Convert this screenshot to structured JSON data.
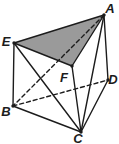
{
  "figure": {
    "type": "triangular-prism",
    "canvas": {
      "width": 119,
      "height": 144,
      "background": "#ffffff"
    },
    "style": {
      "stroke_color": "#1c1c1c",
      "shade_color": "#9a9a9a",
      "stroke_width": 1.4,
      "dash_pattern": "4 3",
      "dot_radius": 1.7,
      "label_font_size": 13
    },
    "vertices": [
      {
        "id": "A",
        "label": "A",
        "x": 104,
        "y": 15,
        "lx": 110,
        "ly": 13
      },
      {
        "id": "B",
        "label": "B",
        "x": 13,
        "y": 106,
        "lx": 6,
        "ly": 116
      },
      {
        "id": "C",
        "label": "C",
        "x": 81,
        "y": 132,
        "lx": 78,
        "ly": 143
      },
      {
        "id": "D",
        "label": "D",
        "x": 108,
        "y": 80,
        "lx": 113,
        "ly": 84
      },
      {
        "id": "E",
        "label": "E",
        "x": 14,
        "y": 43,
        "lx": 6,
        "ly": 46
      },
      {
        "id": "F",
        "label": "F",
        "x": 72,
        "y": 66,
        "lx": 64,
        "ly": 82
      }
    ],
    "shaded_face": [
      "E",
      "A",
      "F"
    ],
    "edges": [
      {
        "from": "E",
        "to": "A",
        "style": "solid"
      },
      {
        "from": "A",
        "to": "F",
        "style": "solid"
      },
      {
        "from": "F",
        "to": "E",
        "style": "solid"
      },
      {
        "from": "E",
        "to": "B",
        "style": "solid"
      },
      {
        "from": "A",
        "to": "D",
        "style": "solid"
      },
      {
        "from": "F",
        "to": "C",
        "style": "solid"
      },
      {
        "from": "B",
        "to": "C",
        "style": "solid"
      },
      {
        "from": "C",
        "to": "D",
        "style": "solid"
      },
      {
        "from": "E",
        "to": "C",
        "style": "solid"
      },
      {
        "from": "A",
        "to": "C",
        "style": "solid"
      },
      {
        "from": "A",
        "to": "B",
        "style": "dashed"
      },
      {
        "from": "B",
        "to": "D",
        "style": "dashed"
      }
    ]
  }
}
